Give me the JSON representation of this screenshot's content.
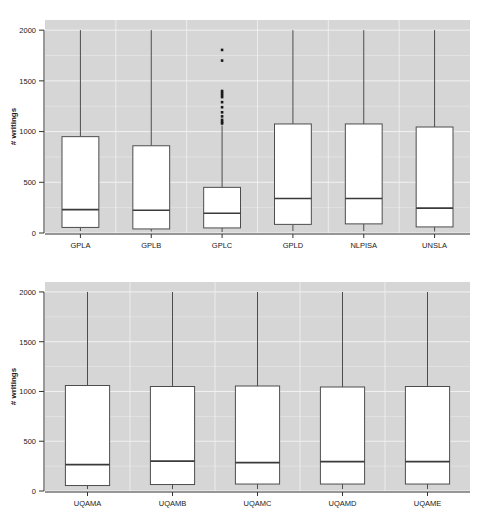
{
  "chart_data": [
    {
      "type": "box",
      "panel": "top",
      "title": "",
      "xlabel": "",
      "ylabel": "# writings",
      "ylim": [
        0,
        2100
      ],
      "yticks": [
        0,
        500,
        1000,
        1500,
        2000
      ],
      "ytick_labels": [
        "0",
        "500",
        "1000",
        "1500",
        "2000"
      ],
      "grid": true,
      "grid_color": "#f2f2f2",
      "panel_bg": "#d6d6d6",
      "box_fill": "#ffffff",
      "box_edge": "#4d4d4d",
      "categories": [
        "GPLA",
        "GPLB",
        "GPLC",
        "GPLD",
        "NLPISA",
        "UNSLA"
      ],
      "boxes": [
        {
          "label": "GPLA",
          "whislo": 20,
          "q1": 55,
          "med": 230,
          "q3": 950,
          "whishi": 2000,
          "outliers": []
        },
        {
          "label": "GPLB",
          "whislo": 15,
          "q1": 40,
          "med": 225,
          "q3": 860,
          "whishi": 2000,
          "outliers": []
        },
        {
          "label": "GPLC",
          "whislo": 10,
          "q1": 50,
          "med": 195,
          "q3": 450,
          "whishi": 1060,
          "outliers": [
            1080,
            1095,
            1115,
            1150,
            1190,
            1240,
            1290,
            1340,
            1360,
            1380,
            1400,
            1700,
            1805
          ]
        },
        {
          "label": "GPLD",
          "whislo": 20,
          "q1": 85,
          "med": 340,
          "q3": 1075,
          "whishi": 2000,
          "outliers": []
        },
        {
          "label": "NLPISA",
          "whislo": 20,
          "q1": 90,
          "med": 340,
          "q3": 1075,
          "whishi": 2000,
          "outliers": []
        },
        {
          "label": "UNSLA",
          "whislo": 15,
          "q1": 60,
          "med": 245,
          "q3": 1045,
          "whishi": 2000,
          "outliers": []
        }
      ]
    },
    {
      "type": "box",
      "panel": "bottom",
      "title": "",
      "xlabel": "",
      "ylabel": "# writings",
      "ylim": [
        0,
        2100
      ],
      "yticks": [
        0,
        500,
        1000,
        1500,
        2000
      ],
      "ytick_labels": [
        "0",
        "500",
        "1000",
        "1500",
        "2000"
      ],
      "grid": true,
      "grid_color": "#f2f2f2",
      "panel_bg": "#d6d6d6",
      "box_fill": "#ffffff",
      "box_edge": "#4d4d4d",
      "categories": [
        "UQAMA",
        "UQAMB",
        "UQAMC",
        "UQAMD",
        "UQAME"
      ],
      "boxes": [
        {
          "label": "UQAMA",
          "whislo": 20,
          "q1": 55,
          "med": 265,
          "q3": 1060,
          "whishi": 2000,
          "outliers": []
        },
        {
          "label": "UQAMB",
          "whislo": 20,
          "q1": 65,
          "med": 300,
          "q3": 1050,
          "whishi": 2000,
          "outliers": []
        },
        {
          "label": "UQAMC",
          "whislo": 20,
          "q1": 70,
          "med": 285,
          "q3": 1055,
          "whishi": 2000,
          "outliers": []
        },
        {
          "label": "UQAMD",
          "whislo": 20,
          "q1": 70,
          "med": 295,
          "q3": 1045,
          "whishi": 2000,
          "outliers": []
        },
        {
          "label": "UQAME",
          "whislo": 20,
          "q1": 70,
          "med": 295,
          "q3": 1050,
          "whishi": 2000,
          "outliers": []
        }
      ]
    }
  ]
}
